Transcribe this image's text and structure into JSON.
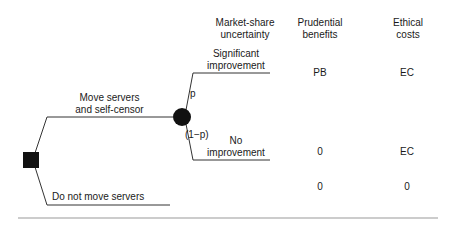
{
  "headers": {
    "uncertainty": [
      "Market-share",
      "uncertainty"
    ],
    "benefits": [
      "Prudential",
      "benefits"
    ],
    "costs": [
      "Ethical",
      "costs"
    ]
  },
  "decision_node": {
    "type": "decision",
    "shape": "square"
  },
  "chance_node": {
    "type": "chance",
    "shape": "circle"
  },
  "branches": {
    "move": {
      "label": [
        "Move servers",
        "and self-censor"
      ]
    },
    "not_move": {
      "label": "Do not move servers"
    },
    "significant": {
      "label": [
        "Significant",
        "improvement"
      ],
      "probability": "p"
    },
    "no_improvement": {
      "label": [
        "No",
        "improvement"
      ],
      "probability": "(1−p)"
    }
  },
  "outcomes": [
    {
      "branch": "Significant improvement",
      "prudential_benefits": "PB",
      "ethical_costs": "EC"
    },
    {
      "branch": "No improvement",
      "prudential_benefits": "0",
      "ethical_costs": "EC"
    },
    {
      "branch": "Do not move servers",
      "prudential_benefits": "0",
      "ethical_costs": "0"
    }
  ],
  "colors": {
    "line": "#333333",
    "node": "#111111",
    "rule": "#888888"
  }
}
